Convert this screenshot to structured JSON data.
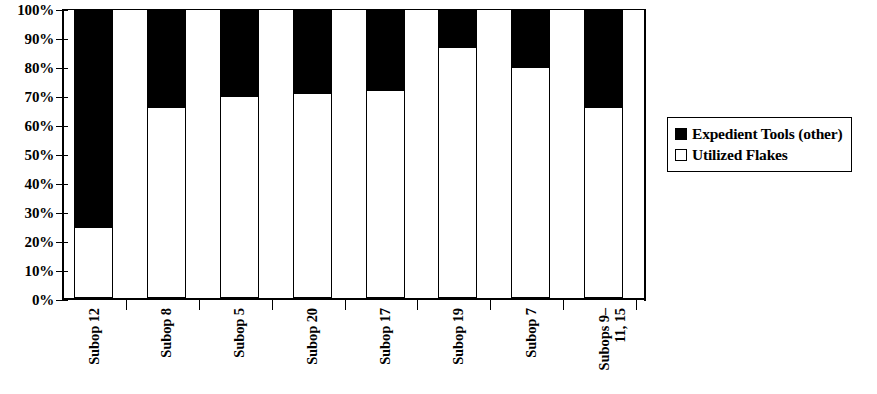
{
  "chart_data": {
    "type": "bar",
    "subtype": "100% stacked bar",
    "title": "",
    "subtitle": "",
    "xlabel": "",
    "ylabel": "",
    "ylim": [
      0,
      100
    ],
    "grid": false,
    "legend_position": "right",
    "categories": [
      "Subop 12",
      "Subop 8",
      "Subop 5",
      "Subop 20",
      "Subop 17",
      "Subop 19",
      "Subop 7",
      "Subops 9–\n11, 15"
    ],
    "category_labels_flat": [
      "Subop 12",
      "Subop 8",
      "Subop 5",
      "Subop 20",
      "Subop 17",
      "Subop 19",
      "Subop 7",
      "Subops 9–11, 15"
    ],
    "series": [
      {
        "name": "Utilized Flakes",
        "color": "#ffffff",
        "values": [
          24,
          66,
          70,
          71,
          72,
          87,
          80,
          66
        ]
      },
      {
        "name": "Expedient Tools (other)",
        "color": "#000000",
        "values": [
          76,
          34,
          30,
          29,
          28,
          13,
          20,
          34
        ]
      }
    ],
    "ytick_labels": [
      "100%",
      "90%",
      "80%",
      "70%",
      "60%",
      "50%",
      "40%",
      "30%",
      "20%",
      "10%",
      "0%"
    ],
    "ytick_values": [
      100,
      90,
      80,
      70,
      60,
      50,
      40,
      30,
      20,
      10,
      0
    ]
  },
  "legend": {
    "entries": [
      {
        "label": "Expedient Tools (other)",
        "swatch": "filled"
      },
      {
        "label": "Utilized Flakes",
        "swatch": "hollow"
      }
    ]
  },
  "colors": {
    "expedient_tools": "#000000",
    "utilized_flakes": "#ffffff",
    "axis": "#000000"
  }
}
